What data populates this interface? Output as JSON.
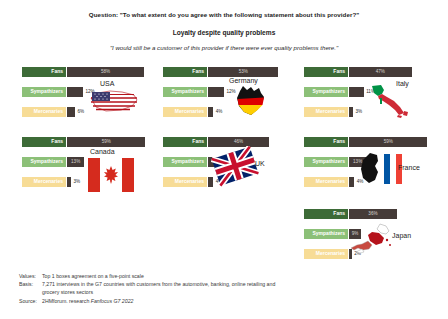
{
  "header": {
    "question": "Question: \"To what extent do you agree with the following statement about this provider?\"",
    "section_title": "Loyalty despite quality problems",
    "statement": "\"I would still be a customer of this provider if there were ever quality problems there.\""
  },
  "categories": [
    "Fans",
    "Sympathizers",
    "Mercenaries"
  ],
  "colors": {
    "fans": "#3d6b37",
    "sympathizers": "#8cc078",
    "mercenaries": "#f7dc96",
    "bar": "#453b38"
  },
  "chart_data": {
    "type": "bar",
    "title": "Loyalty despite quality problems",
    "xlabel": "",
    "ylabel": "",
    "xlim": [
      0,
      60
    ],
    "categories": [
      "Fans",
      "Sympathizers",
      "Mercenaries"
    ],
    "series": [
      {
        "name": "USA",
        "values": [
          58,
          12,
          6
        ]
      },
      {
        "name": "Germany",
        "values": [
          53,
          12,
          4
        ]
      },
      {
        "name": "Italy",
        "values": [
          47,
          11,
          3
        ]
      },
      {
        "name": "Canada",
        "values": [
          59,
          13,
          3
        ]
      },
      {
        "name": "UK",
        "values": [
          46,
          16,
          4
        ]
      },
      {
        "name": "France",
        "values": [
          59,
          13,
          4
        ]
      },
      {
        "name": "Japan",
        "values": [
          36,
          9,
          2
        ]
      }
    ]
  },
  "panels": [
    {
      "country": "USA",
      "flag": "usa-flag",
      "rows": [
        {
          "label": "Fans",
          "value": "58%",
          "pct": 58,
          "inside": true
        },
        {
          "label": "Sympathizers",
          "value": "12%",
          "pct": 12,
          "inside": false
        },
        {
          "label": "Mercenaries",
          "value": "6%",
          "pct": 6,
          "inside": false
        }
      ]
    },
    {
      "country": "Germany",
      "flag": "germany-flag",
      "rows": [
        {
          "label": "Fans",
          "value": "53%",
          "pct": 53,
          "inside": true
        },
        {
          "label": "Sympathizers",
          "value": "12%",
          "pct": 12,
          "inside": false
        },
        {
          "label": "Mercenaries",
          "value": "4%",
          "pct": 4,
          "inside": false
        }
      ]
    },
    {
      "country": "Italy",
      "flag": "italy-flag",
      "rows": [
        {
          "label": "Fans",
          "value": "47%",
          "pct": 47,
          "inside": true
        },
        {
          "label": "Sympathizers",
          "value": "11%",
          "pct": 11,
          "inside": false
        },
        {
          "label": "Mercenaries",
          "value": "3%",
          "pct": 3,
          "inside": false
        }
      ]
    },
    {
      "country": "Canada",
      "flag": "canada-flag",
      "rows": [
        {
          "label": "Fans",
          "value": "59%",
          "pct": 59,
          "inside": true
        },
        {
          "label": "Sympathizers",
          "value": "13%",
          "pct": 13,
          "inside": true
        },
        {
          "label": "Mercenaries",
          "value": "3%",
          "pct": 3,
          "inside": false
        }
      ]
    },
    {
      "country": "UK",
      "flag": "uk-flag",
      "rows": [
        {
          "label": "Fans",
          "value": "46%",
          "pct": 46,
          "inside": true
        },
        {
          "label": "Sympathizers",
          "value": "16%",
          "pct": 16,
          "inside": true
        },
        {
          "label": "Mercenaries",
          "value": "4%",
          "pct": 4,
          "inside": false
        }
      ]
    },
    {
      "country": "France",
      "flag": "france-flag",
      "rows": [
        {
          "label": "Fans",
          "value": "59%",
          "pct": 59,
          "inside": true
        },
        {
          "label": "Sympathizers",
          "value": "13%",
          "pct": 13,
          "inside": true
        },
        {
          "label": "Mercenaries",
          "value": "4%",
          "pct": 4,
          "inside": false
        }
      ]
    },
    {
      "country": "Japan",
      "flag": "japan-flag",
      "rows": [
        {
          "label": "Fans",
          "value": "36%",
          "pct": 36,
          "inside": true
        },
        {
          "label": "Sympathizers",
          "value": "9%",
          "pct": 9,
          "inside": true
        },
        {
          "label": "Mercenaries",
          "value": "2%",
          "pct": 2,
          "inside": false
        }
      ]
    }
  ],
  "footer": {
    "values_key": "Values:",
    "values_text": "Top 1 boxes agreement on a five-point scale",
    "basis_key": "Basis:",
    "basis_text": "7,271 interviews in the G7 countries with customers from the automotive, banking, online retailing and",
    "basis_text2": "grocery stores sectors",
    "source_key": "Source:",
    "source_text": "2HMforum. research ",
    "source_italic": "Fanfocus G7 2022"
  }
}
